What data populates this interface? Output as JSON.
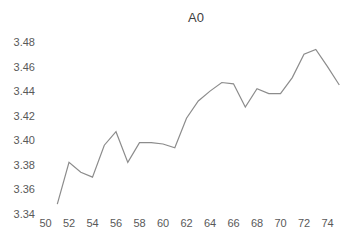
{
  "chart_data": {
    "type": "line",
    "title": "A0",
    "xlabel": "",
    "ylabel": "",
    "xlim": [
      50,
      75
    ],
    "ylim": [
      3.34,
      3.48
    ],
    "x_ticks": [
      50,
      52,
      54,
      56,
      58,
      60,
      62,
      64,
      66,
      68,
      70,
      72,
      74
    ],
    "y_ticks": [
      "3.34",
      "3.36",
      "3.38",
      "3.40",
      "3.42",
      "3.44",
      "3.46",
      "3.48"
    ],
    "grid": false,
    "legend": "none",
    "series": [
      {
        "name": "A0",
        "color": "#8c8c8c",
        "x": [
          51,
          52,
          53,
          54,
          55,
          56,
          57,
          58,
          59,
          60,
          61,
          62,
          63,
          64,
          65,
          66,
          67,
          68,
          69,
          70,
          71,
          72,
          73,
          74,
          75
        ],
        "values": [
          3.348,
          3.382,
          3.374,
          3.37,
          3.396,
          3.407,
          3.382,
          3.398,
          3.398,
          3.397,
          3.394,
          3.418,
          3.432,
          3.44,
          3.447,
          3.446,
          3.427,
          3.442,
          3.438,
          3.438,
          3.451,
          3.47,
          3.474,
          3.46,
          3.445
        ]
      }
    ]
  }
}
